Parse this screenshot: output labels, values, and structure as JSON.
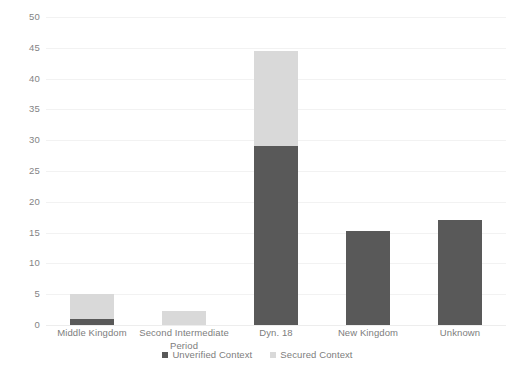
{
  "chart_data": {
    "type": "bar",
    "stacked": true,
    "title": "",
    "subtitle": "",
    "xlabel": "",
    "ylabel": "",
    "ylim": [
      0,
      50
    ],
    "yticks": [
      0,
      5,
      10,
      15,
      20,
      25,
      30,
      35,
      40,
      45,
      50
    ],
    "ytick_labels": [
      "0",
      "5",
      "10",
      "15",
      "20",
      "25",
      "30",
      "35",
      "40",
      "45",
      "50"
    ],
    "grid": true,
    "legend_position": "bottom-center",
    "categories": [
      "Middle Kingdom",
      "Second Intermediate Period",
      "Dyn. 18",
      "New Kingdom",
      "Unknown"
    ],
    "series": [
      {
        "name": "Unverified Context",
        "color": "#595959",
        "values": [
          1,
          0,
          29,
          15.2,
          17
        ]
      },
      {
        "name": "Secured Context",
        "color": "#d9d9d9",
        "values": [
          4,
          2.3,
          15.5,
          0,
          0
        ]
      }
    ],
    "totals": [
      5,
      2.3,
      44.5,
      15.2,
      17
    ]
  },
  "legend": {
    "items": [
      {
        "label": "Unverified Context",
        "color": "#595959"
      },
      {
        "label": "Secured Context",
        "color": "#d9d9d9"
      }
    ]
  },
  "artifact": {
    "bottom_text": ""
  }
}
